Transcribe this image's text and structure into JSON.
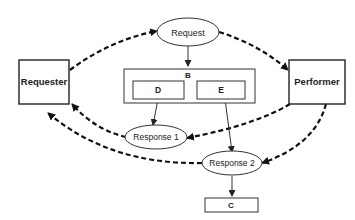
{
  "diagram": {
    "nodes": {
      "requester": {
        "label": "Requester",
        "shape": "box"
      },
      "performer": {
        "label": "Performer",
        "shape": "box"
      },
      "request": {
        "label": "Request",
        "shape": "ellipse"
      },
      "b": {
        "label": "B",
        "shape": "box"
      },
      "d": {
        "label": "D",
        "shape": "box"
      },
      "e": {
        "label": "E",
        "shape": "box"
      },
      "response1": {
        "label": "Response 1",
        "shape": "ellipse"
      },
      "response2": {
        "label": "Response 2",
        "shape": "ellipse"
      },
      "c": {
        "label": "C",
        "shape": "box"
      }
    },
    "edges": [
      {
        "from": "Requester",
        "to": "Request",
        "style": "dashed"
      },
      {
        "from": "Request",
        "to": "Performer",
        "style": "dashed"
      },
      {
        "from": "Request",
        "to": "B",
        "style": "solid"
      },
      {
        "from": "D",
        "to": "Response 1",
        "style": "solid"
      },
      {
        "from": "E",
        "to": "Response 2",
        "style": "solid"
      },
      {
        "from": "Performer",
        "to": "Response 1",
        "style": "dashed"
      },
      {
        "from": "Response 1",
        "to": "Requester",
        "style": "dashed"
      },
      {
        "from": "Performer",
        "to": "Response 2",
        "style": "dashed"
      },
      {
        "from": "Response 2",
        "to": "Requester",
        "style": "dashed"
      },
      {
        "from": "Response 2",
        "to": "C",
        "style": "solid"
      }
    ]
  }
}
